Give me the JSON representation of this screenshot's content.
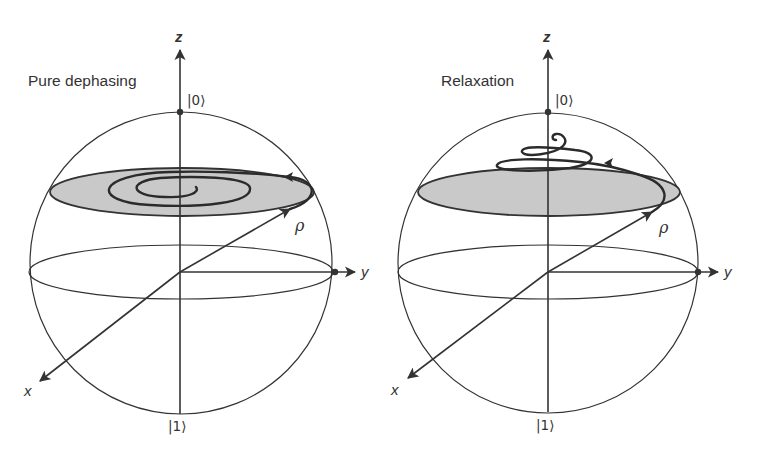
{
  "figure": {
    "panels": [
      {
        "id": "pure-dephasing",
        "title": "Pure dephasing",
        "axis_labels": {
          "x": "x",
          "y": "y",
          "z": "z"
        },
        "pole_labels": {
          "north": "|0⟩",
          "south": "|1⟩"
        },
        "vector_label": "ρ",
        "trajectory": "spiral inward in the horizontal plane toward the z-axis",
        "colors": {
          "disk": "#c9c9c9",
          "ink": "#333333"
        }
      },
      {
        "id": "relaxation",
        "title": "Relaxation",
        "axis_labels": {
          "x": "x",
          "y": "y",
          "z": "z"
        },
        "pole_labels": {
          "north": "|0⟩",
          "south": "|1⟩"
        },
        "vector_label": "ρ",
        "trajectory": "spiral rising toward the |0⟩ pole",
        "colors": {
          "disk": "#c9c9c9",
          "ink": "#333333"
        }
      }
    ]
  }
}
